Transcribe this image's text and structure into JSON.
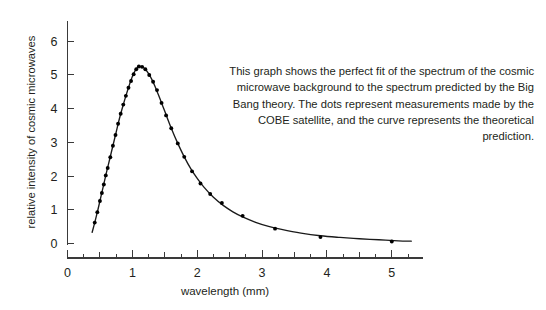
{
  "chart_data": {
    "type": "line",
    "title": "",
    "xlabel": "wavelength (mm)",
    "ylabel": "relative intensity of cosmic microwaves",
    "xlim": [
      0,
      5.45
    ],
    "ylim": [
      0,
      6.6
    ],
    "xticks": [
      0,
      1,
      2,
      3,
      4,
      5
    ],
    "xticklabels": [
      "0",
      "1",
      "2",
      "3",
      "4",
      "5"
    ],
    "xminor_step": 0.25,
    "yticks": [
      0,
      1,
      2,
      3,
      4,
      5,
      6
    ],
    "yticklabels": [
      "0",
      "1",
      "2",
      "3",
      "4",
      "5",
      "6"
    ],
    "grid": false,
    "legend": false,
    "series": [
      {
        "name": "theoretical prediction",
        "kind": "line",
        "color": "#1a1a1a",
        "x": [
          0.38,
          0.42,
          0.46,
          0.5,
          0.55,
          0.6,
          0.65,
          0.7,
          0.75,
          0.8,
          0.85,
          0.9,
          0.95,
          1.0,
          1.05,
          1.1,
          1.15,
          1.2,
          1.25,
          1.3,
          1.35,
          1.4,
          1.45,
          1.5,
          1.6,
          1.7,
          1.8,
          1.9,
          2.0,
          2.1,
          2.25,
          2.4,
          2.55,
          2.7,
          2.9,
          3.1,
          3.3,
          3.6,
          3.9,
          4.2,
          4.5,
          4.8,
          5.1,
          5.3
        ],
        "y": [
          0.33,
          0.62,
          0.93,
          1.26,
          1.68,
          2.1,
          2.5,
          2.9,
          3.3,
          3.7,
          4.05,
          4.38,
          4.68,
          4.95,
          5.15,
          5.25,
          5.24,
          5.17,
          5.04,
          4.87,
          4.66,
          4.42,
          4.17,
          3.92,
          3.42,
          2.97,
          2.57,
          2.22,
          1.93,
          1.68,
          1.37,
          1.13,
          0.94,
          0.79,
          0.63,
          0.51,
          0.42,
          0.31,
          0.23,
          0.18,
          0.14,
          0.11,
          0.08,
          0.07
        ]
      },
      {
        "name": "COBE measurements",
        "kind": "scatter",
        "color": "#000000",
        "x": [
          0.42,
          0.46,
          0.5,
          0.53,
          0.56,
          0.59,
          0.62,
          0.66,
          0.7,
          0.74,
          0.78,
          0.82,
          0.86,
          0.9,
          0.94,
          0.98,
          1.02,
          1.06,
          1.1,
          1.15,
          1.2,
          1.26,
          1.32,
          1.38,
          1.45,
          1.52,
          1.6,
          1.7,
          1.8,
          1.92,
          2.05,
          2.2,
          2.38,
          2.7,
          3.2,
          3.9,
          5.0
        ],
        "y": [
          0.62,
          0.93,
          1.26,
          1.5,
          1.75,
          2.02,
          2.24,
          2.56,
          2.9,
          3.22,
          3.55,
          3.85,
          4.12,
          4.38,
          4.62,
          4.82,
          5.02,
          5.17,
          5.25,
          5.24,
          5.17,
          5.0,
          4.8,
          4.55,
          4.17,
          3.8,
          3.42,
          2.97,
          2.57,
          2.14,
          1.78,
          1.47,
          1.2,
          0.82,
          0.44,
          0.19,
          0.06
        ]
      }
    ]
  },
  "annotation": {
    "text": "This graph shows the perfect fit of the spectrum of the cosmic microwave background to the spectrum predicted by the Big Bang theory. The dots represent measurements made by the COBE satellite, and the curve represents the theoretical prediction."
  }
}
